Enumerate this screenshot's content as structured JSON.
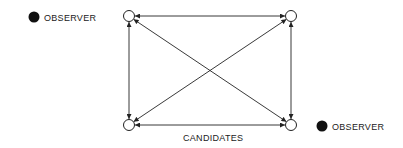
{
  "diagram": {
    "labels": {
      "observer_top": "OBSERVER",
      "observer_bottom": "OBSERVER",
      "candidates": "CANDIDATES"
    },
    "nodes": [
      {
        "id": "top-left",
        "x": 129,
        "y": 16
      },
      {
        "id": "top-right",
        "x": 291,
        "y": 16
      },
      {
        "id": "bottom-left",
        "x": 129,
        "y": 125
      },
      {
        "id": "bottom-right",
        "x": 291,
        "y": 125
      }
    ],
    "observers": [
      {
        "id": "observer-top",
        "x": 34,
        "y": 17
      },
      {
        "id": "observer-bottom",
        "x": 325,
        "y": 125
      }
    ],
    "edges": [
      {
        "from": "top-left",
        "to": "top-right",
        "bidirectional": true
      },
      {
        "from": "bottom-left",
        "to": "bottom-right",
        "bidirectional": true
      },
      {
        "from": "top-left",
        "to": "bottom-left",
        "bidirectional": true
      },
      {
        "from": "top-right",
        "to": "bottom-right",
        "bidirectional": true
      },
      {
        "from": "top-left",
        "to": "bottom-right",
        "bidirectional": true
      },
      {
        "from": "top-right",
        "to": "bottom-left",
        "bidirectional": true
      }
    ],
    "colors": {
      "stroke": "#222222",
      "background": "#ffffff"
    }
  }
}
